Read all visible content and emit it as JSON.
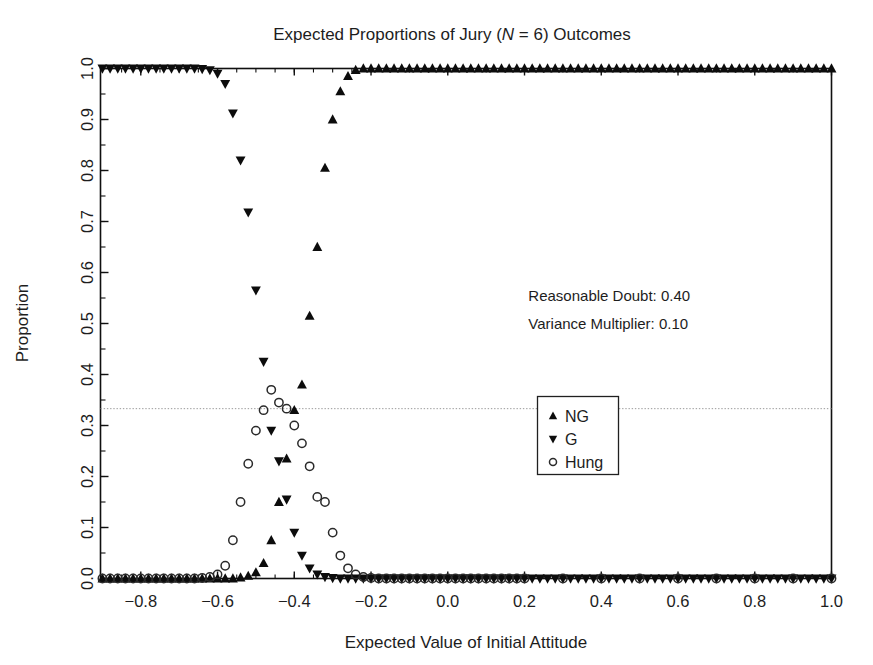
{
  "chart_data": {
    "type": "scatter",
    "title": "Expected Proportions of Jury (N = 6) Outcomes",
    "title_prefix": "Expected Proportions of Jury (",
    "title_italic": "N",
    "title_suffix": " = 6) Outcomes",
    "xlabel": "Expected Value of Initial Attitude",
    "ylabel": "Proportion",
    "xlim": [
      -0.905,
      1.0
    ],
    "ylim": [
      0.0,
      1.0
    ],
    "xticks": [
      -0.8,
      -0.6,
      -0.4,
      -0.2,
      0.0,
      0.2,
      0.4,
      0.6,
      0.8,
      1.0
    ],
    "xticklabels": [
      "-0.8",
      "-0.6",
      "-0.4",
      "-0.2",
      "0.0",
      "0.2",
      "0.4",
      "0.6",
      "0.8",
      "1.0"
    ],
    "yticks": [
      0.0,
      0.1,
      0.2,
      0.3,
      0.4,
      0.5,
      0.6,
      0.7,
      0.8,
      0.9,
      1.0
    ],
    "yticklabels": [
      "0.0",
      "0.1",
      "0.2",
      "0.3",
      "0.4",
      "0.5",
      "0.6",
      "0.7",
      "0.8",
      "0.9",
      "1.0"
    ],
    "grid": false,
    "legend_position": "center-right",
    "reference_line": {
      "axis": "y",
      "value": 0.333,
      "style": "dotted"
    },
    "series": [
      {
        "name": "NG",
        "marker": "triangle-up",
        "color": "#0c0c0c",
        "points": [
          [
            -0.9,
            0.0
          ],
          [
            -0.88,
            0.0
          ],
          [
            -0.86,
            0.0
          ],
          [
            -0.84,
            0.0
          ],
          [
            -0.82,
            0.0
          ],
          [
            -0.8,
            0.0
          ],
          [
            -0.78,
            0.0
          ],
          [
            -0.76,
            0.0
          ],
          [
            -0.74,
            0.0
          ],
          [
            -0.72,
            0.0
          ],
          [
            -0.7,
            0.0
          ],
          [
            -0.68,
            0.0
          ],
          [
            -0.66,
            0.0
          ],
          [
            -0.64,
            0.0
          ],
          [
            -0.62,
            0.0
          ],
          [
            -0.6,
            0.0
          ],
          [
            -0.58,
            0.0
          ],
          [
            -0.56,
            0.0
          ],
          [
            -0.54,
            0.002
          ],
          [
            -0.52,
            0.005
          ],
          [
            -0.5,
            0.012
          ],
          [
            -0.48,
            0.03
          ],
          [
            -0.46,
            0.075
          ],
          [
            -0.44,
            0.15
          ],
          [
            -0.42,
            0.235
          ],
          [
            -0.4,
            0.33
          ],
          [
            -0.38,
            0.38
          ],
          [
            -0.36,
            0.515
          ],
          [
            -0.34,
            0.65
          ],
          [
            -0.32,
            0.805
          ],
          [
            -0.3,
            0.9
          ],
          [
            -0.28,
            0.955
          ],
          [
            -0.26,
            0.985
          ],
          [
            -0.24,
            0.997
          ],
          [
            -0.22,
            1.0
          ],
          [
            -0.2,
            1.0
          ],
          [
            -0.18,
            1.0
          ],
          [
            -0.16,
            1.0
          ],
          [
            -0.14,
            1.0
          ],
          [
            -0.12,
            1.0
          ],
          [
            -0.1,
            1.0
          ],
          [
            -0.08,
            1.0
          ],
          [
            -0.06,
            1.0
          ],
          [
            -0.04,
            1.0
          ],
          [
            -0.02,
            1.0
          ],
          [
            0.0,
            1.0
          ],
          [
            0.02,
            1.0
          ],
          [
            0.04,
            1.0
          ],
          [
            0.06,
            1.0
          ],
          [
            0.08,
            1.0
          ],
          [
            0.1,
            1.0
          ],
          [
            0.12,
            1.0
          ],
          [
            0.14,
            1.0
          ],
          [
            0.16,
            1.0
          ],
          [
            0.18,
            1.0
          ],
          [
            0.2,
            1.0
          ],
          [
            0.22,
            1.0
          ],
          [
            0.24,
            1.0
          ],
          [
            0.26,
            1.0
          ],
          [
            0.28,
            1.0
          ],
          [
            0.3,
            1.0
          ],
          [
            0.32,
            1.0
          ],
          [
            0.34,
            1.0
          ],
          [
            0.36,
            1.0
          ],
          [
            0.38,
            1.0
          ],
          [
            0.4,
            1.0
          ],
          [
            0.42,
            1.0
          ],
          [
            0.44,
            1.0
          ],
          [
            0.46,
            1.0
          ],
          [
            0.48,
            1.0
          ],
          [
            0.5,
            1.0
          ],
          [
            0.52,
            1.0
          ],
          [
            0.54,
            1.0
          ],
          [
            0.56,
            1.0
          ],
          [
            0.58,
            1.0
          ],
          [
            0.6,
            1.0
          ],
          [
            0.62,
            1.0
          ],
          [
            0.64,
            1.0
          ],
          [
            0.66,
            1.0
          ],
          [
            0.68,
            1.0
          ],
          [
            0.7,
            1.0
          ],
          [
            0.72,
            1.0
          ],
          [
            0.74,
            1.0
          ],
          [
            0.76,
            1.0
          ],
          [
            0.78,
            1.0
          ],
          [
            0.8,
            1.0
          ],
          [
            0.82,
            1.0
          ],
          [
            0.84,
            1.0
          ],
          [
            0.86,
            1.0
          ],
          [
            0.88,
            1.0
          ],
          [
            0.9,
            1.0
          ],
          [
            0.92,
            1.0
          ],
          [
            0.94,
            1.0
          ],
          [
            0.96,
            1.0
          ],
          [
            0.98,
            1.0
          ],
          [
            1.0,
            1.0
          ]
        ]
      },
      {
        "name": "G",
        "marker": "triangle-down",
        "color": "#0c0c0c",
        "points": [
          [
            -0.9,
            1.0
          ],
          [
            -0.88,
            1.0
          ],
          [
            -0.86,
            1.0
          ],
          [
            -0.84,
            1.0
          ],
          [
            -0.82,
            1.0
          ],
          [
            -0.8,
            1.0
          ],
          [
            -0.78,
            1.0
          ],
          [
            -0.76,
            1.0
          ],
          [
            -0.74,
            1.0
          ],
          [
            -0.72,
            1.0
          ],
          [
            -0.7,
            1.0
          ],
          [
            -0.68,
            1.0
          ],
          [
            -0.66,
            1.0
          ],
          [
            -0.64,
            0.999
          ],
          [
            -0.62,
            0.997
          ],
          [
            -0.6,
            0.99
          ],
          [
            -0.58,
            0.97
          ],
          [
            -0.56,
            0.912
          ],
          [
            -0.54,
            0.82
          ],
          [
            -0.52,
            0.718
          ],
          [
            -0.5,
            0.565
          ],
          [
            -0.48,
            0.425
          ],
          [
            -0.46,
            0.29
          ],
          [
            -0.44,
            0.23
          ],
          [
            -0.42,
            0.155
          ],
          [
            -0.4,
            0.09
          ],
          [
            -0.38,
            0.045
          ],
          [
            -0.36,
            0.02
          ],
          [
            -0.34,
            0.008
          ],
          [
            -0.32,
            0.003
          ],
          [
            -0.3,
            0.001
          ],
          [
            -0.28,
            0.0
          ],
          [
            -0.26,
            0.0
          ],
          [
            -0.24,
            0.0
          ],
          [
            -0.22,
            0.0
          ],
          [
            -0.2,
            0.0
          ],
          [
            -0.18,
            0.0
          ],
          [
            -0.16,
            0.0
          ],
          [
            -0.14,
            0.0
          ],
          [
            -0.12,
            0.0
          ],
          [
            -0.1,
            0.0
          ],
          [
            -0.08,
            0.0
          ],
          [
            -0.06,
            0.0
          ],
          [
            -0.04,
            0.0
          ],
          [
            -0.02,
            0.0
          ],
          [
            0.0,
            0.0
          ],
          [
            0.02,
            0.0
          ],
          [
            0.04,
            0.0
          ],
          [
            0.06,
            0.0
          ],
          [
            0.08,
            0.0
          ],
          [
            0.1,
            0.0
          ],
          [
            0.12,
            0.0
          ],
          [
            0.14,
            0.0
          ],
          [
            0.16,
            0.0
          ],
          [
            0.18,
            0.0
          ],
          [
            0.2,
            0.0
          ],
          [
            0.22,
            0.0
          ],
          [
            0.24,
            0.0
          ],
          [
            0.26,
            0.0
          ],
          [
            0.28,
            0.0
          ],
          [
            0.3,
            0.0
          ],
          [
            0.32,
            0.0
          ],
          [
            0.34,
            0.0
          ],
          [
            0.36,
            0.0
          ],
          [
            0.38,
            0.0
          ],
          [
            0.4,
            0.0
          ],
          [
            0.42,
            0.0
          ],
          [
            0.44,
            0.0
          ],
          [
            0.46,
            0.0
          ],
          [
            0.48,
            0.0
          ],
          [
            0.5,
            0.0
          ],
          [
            0.52,
            0.0
          ],
          [
            0.54,
            0.0
          ],
          [
            0.56,
            0.0
          ],
          [
            0.58,
            0.0
          ],
          [
            0.6,
            0.0
          ],
          [
            0.62,
            0.0
          ],
          [
            0.64,
            0.0
          ],
          [
            0.66,
            0.0
          ],
          [
            0.68,
            0.0
          ],
          [
            0.7,
            0.0
          ],
          [
            0.72,
            0.0
          ],
          [
            0.74,
            0.0
          ],
          [
            0.76,
            0.0
          ],
          [
            0.78,
            0.0
          ],
          [
            0.8,
            0.0
          ],
          [
            0.82,
            0.0
          ],
          [
            0.84,
            0.0
          ],
          [
            0.86,
            0.0
          ],
          [
            0.88,
            0.0
          ],
          [
            0.9,
            0.0
          ],
          [
            0.92,
            0.0
          ],
          [
            0.94,
            0.0
          ],
          [
            0.96,
            0.0
          ],
          [
            0.98,
            0.0
          ],
          [
            1.0,
            0.0
          ]
        ]
      },
      {
        "name": "Hung",
        "marker": "circle-open",
        "color": "#2a2a2a",
        "points": [
          [
            -0.9,
            0.0
          ],
          [
            -0.88,
            0.0
          ],
          [
            -0.86,
            0.0
          ],
          [
            -0.84,
            0.0
          ],
          [
            -0.82,
            0.0
          ],
          [
            -0.8,
            0.0
          ],
          [
            -0.78,
            0.0
          ],
          [
            -0.76,
            0.0
          ],
          [
            -0.74,
            0.0
          ],
          [
            -0.72,
            0.0
          ],
          [
            -0.7,
            0.0
          ],
          [
            -0.68,
            0.0
          ],
          [
            -0.66,
            0.0
          ],
          [
            -0.64,
            0.001
          ],
          [
            -0.62,
            0.003
          ],
          [
            -0.6,
            0.008
          ],
          [
            -0.58,
            0.025
          ],
          [
            -0.56,
            0.075
          ],
          [
            -0.54,
            0.15
          ],
          [
            -0.52,
            0.225
          ],
          [
            -0.5,
            0.29
          ],
          [
            -0.48,
            0.33
          ],
          [
            -0.46,
            0.37
          ],
          [
            -0.44,
            0.345
          ],
          [
            -0.42,
            0.333
          ],
          [
            -0.4,
            0.3
          ],
          [
            -0.38,
            0.265
          ],
          [
            -0.36,
            0.22
          ],
          [
            -0.34,
            0.16
          ],
          [
            -0.32,
            0.15
          ],
          [
            -0.3,
            0.09
          ],
          [
            -0.28,
            0.045
          ],
          [
            -0.26,
            0.02
          ],
          [
            -0.24,
            0.008
          ],
          [
            -0.22,
            0.003
          ],
          [
            -0.2,
            0.001
          ],
          [
            -0.18,
            0.0
          ],
          [
            -0.16,
            0.0
          ],
          [
            -0.14,
            0.0
          ],
          [
            -0.12,
            0.0
          ],
          [
            -0.1,
            0.0
          ],
          [
            -0.08,
            0.0
          ],
          [
            -0.06,
            0.0
          ],
          [
            -0.04,
            0.0
          ],
          [
            -0.02,
            0.0
          ],
          [
            0.0,
            0.0
          ],
          [
            0.02,
            0.0
          ],
          [
            0.04,
            0.0
          ],
          [
            0.06,
            0.0
          ],
          [
            0.08,
            0.0
          ],
          [
            0.1,
            0.0
          ],
          [
            0.12,
            0.0
          ],
          [
            0.14,
            0.0
          ],
          [
            0.16,
            0.0
          ],
          [
            0.18,
            0.0
          ],
          [
            0.2,
            0.0
          ],
          [
            0.3,
            0.0
          ],
          [
            0.4,
            0.0
          ],
          [
            0.5,
            0.0
          ],
          [
            0.6,
            0.0
          ],
          [
            0.7,
            0.0
          ],
          [
            0.8,
            0.0
          ],
          [
            0.9,
            0.0
          ],
          [
            1.0,
            0.0
          ]
        ]
      }
    ],
    "annotations": [
      {
        "text": "Reasonable Doubt: 0.40",
        "x": 0.21,
        "y": 0.545
      },
      {
        "text": "Variance Multiplier: 0.10",
        "x": 0.21,
        "y": 0.49
      }
    ],
    "legend_entries": [
      {
        "label": "NG",
        "marker": "triangle-up"
      },
      {
        "label": "G",
        "marker": "triangle-down"
      },
      {
        "label": "Hung",
        "marker": "circle-open"
      }
    ]
  }
}
